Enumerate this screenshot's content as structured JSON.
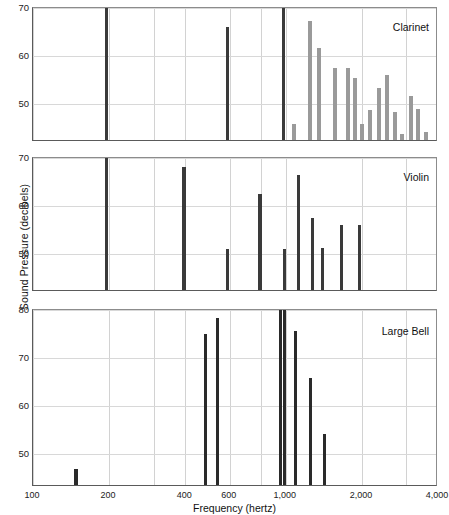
{
  "chart_data": {
    "type": "bar",
    "title": "",
    "xlabel": "Frequency (hertz)",
    "ylabel": "Sound Pressure (decibels)",
    "xscale": "log",
    "xlim": [
      100,
      4000
    ],
    "xticks": [
      100,
      200,
      400,
      600,
      1000,
      2000,
      4000
    ],
    "xticklabels": [
      "100",
      "200",
      "400",
      "600",
      "1,000",
      "2,000",
      "4,000"
    ],
    "gridlines_x": [
      100,
      200,
      300,
      400,
      600,
      800,
      1000,
      2000,
      3000,
      4000
    ],
    "grid": true,
    "legend": "none",
    "panels": [
      {
        "name": "Clarinet",
        "label": "Clarinet",
        "ylim": [
          42,
          70
        ],
        "yticks": [
          50,
          60,
          70
        ],
        "yticklabels": [
          "50",
          "60",
          "70"
        ],
        "bar_color": "#3a3a3a",
        "series": [
          {
            "name": "Clarinet",
            "points": [
              {
                "x": 196,
                "y": 70.0,
                "style": "dark"
              },
              {
                "x": 588,
                "y": 65.6,
                "style": "dark"
              },
              {
                "x": 980,
                "y": 70.0,
                "style": "dark"
              },
              {
                "x": 1080,
                "y": 45.4,
                "style": "light"
              },
              {
                "x": 1250,
                "y": 66.8,
                "style": "light"
              },
              {
                "x": 1350,
                "y": 61.2,
                "style": "light"
              },
              {
                "x": 1560,
                "y": 57.0,
                "style": "light"
              },
              {
                "x": 1760,
                "y": 57.0,
                "style": "light"
              },
              {
                "x": 1880,
                "y": 55.0,
                "style": "light"
              },
              {
                "x": 2010,
                "y": 45.4,
                "style": "light"
              },
              {
                "x": 2160,
                "y": 48.2,
                "style": "light"
              },
              {
                "x": 2330,
                "y": 52.8,
                "style": "light"
              },
              {
                "x": 2520,
                "y": 55.5,
                "style": "light"
              },
              {
                "x": 2700,
                "y": 47.8,
                "style": "light"
              },
              {
                "x": 2880,
                "y": 43.2,
                "style": "light"
              },
              {
                "x": 3120,
                "y": 51.3,
                "style": "light"
              },
              {
                "x": 3330,
                "y": 48.4,
                "style": "light"
              },
              {
                "x": 3600,
                "y": 43.7,
                "style": "light"
              }
            ]
          }
        ]
      },
      {
        "name": "Violin",
        "label": "Violin",
        "ylim": [
          42,
          70
        ],
        "yticks": [
          50,
          60,
          70
        ],
        "yticklabels": [
          "50",
          "60",
          "70"
        ],
        "bar_color": "#3a3a3a",
        "series": [
          {
            "name": "Violin",
            "points": [
              {
                "x": 196,
                "y": 70.0,
                "style": "dark"
              },
              {
                "x": 396,
                "y": 67.8,
                "style": "dark"
              },
              {
                "x": 588,
                "y": 50.6,
                "style": "dark"
              },
              {
                "x": 790,
                "y": 62.0,
                "style": "dark"
              },
              {
                "x": 985,
                "y": 50.6,
                "style": "dark"
              },
              {
                "x": 1120,
                "y": 66.0,
                "style": "dark"
              },
              {
                "x": 1280,
                "y": 57.0,
                "style": "dark"
              },
              {
                "x": 1400,
                "y": 50.8,
                "style": "dark"
              },
              {
                "x": 1660,
                "y": 55.5,
                "style": "dark"
              },
              {
                "x": 1960,
                "y": 55.5,
                "style": "dark"
              }
            ]
          }
        ]
      },
      {
        "name": "Large Bell",
        "label": "Large Bell",
        "ylim": [
          43,
          80
        ],
        "yticks": [
          50,
          60,
          70,
          80
        ],
        "yticklabels": [
          "50",
          "60",
          "70",
          "80"
        ],
        "bar_color": "#2a2a2a",
        "series": [
          {
            "name": "Large Bell",
            "points": [
              {
                "x": 148,
                "y": 46.3,
                "style": "dark"
              },
              {
                "x": 480,
                "y": 74.6,
                "style": "dark"
              },
              {
                "x": 535,
                "y": 78.0,
                "style": "dark"
              },
              {
                "x": 950,
                "y": 80.2,
                "style": "dark"
              },
              {
                "x": 990,
                "y": 80.2,
                "style": "dark"
              },
              {
                "x": 1090,
                "y": 75.2,
                "style": "dark"
              },
              {
                "x": 1250,
                "y": 65.4,
                "style": "dark"
              },
              {
                "x": 1420,
                "y": 53.6,
                "style": "dark"
              }
            ]
          }
        ]
      }
    ]
  }
}
